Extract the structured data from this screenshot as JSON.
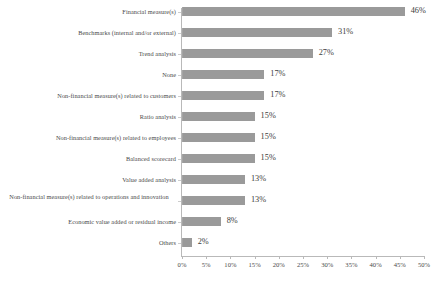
{
  "chart_data": {
    "type": "bar",
    "orientation": "horizontal",
    "title": "",
    "subtitle": "",
    "xlabel": "",
    "ylabel": "",
    "xlim": [
      0,
      50
    ],
    "grid": false,
    "legend": false,
    "bar_color": "#9a9a9a",
    "value_suffix": "%",
    "categories": [
      "Financial measure(s)",
      "Benchmarks (internal and/or external)",
      "Trend analysis",
      "None",
      "Non-financial measure(s) related to customers",
      "Ratio analysis",
      "Non-financial measure(s) related to employees",
      "Balanced scorecard",
      "Value added analysis",
      "Non-financial measure(s) related to operations and innovation",
      "Economic value added or residual income",
      "Others"
    ],
    "values": [
      46,
      31,
      27,
      17,
      17,
      15,
      15,
      15,
      13,
      13,
      8,
      2
    ],
    "value_labels": [
      "46%",
      "31%",
      "27%",
      "17%",
      "17%",
      "15%",
      "15%",
      "15%",
      "13%",
      "13%",
      "8%",
      "2%"
    ],
    "xticks": [
      0,
      5,
      10,
      15,
      20,
      25,
      30,
      35,
      40,
      45,
      50
    ],
    "xtick_labels": [
      "0%",
      "5%",
      "10%",
      "15%",
      "20%",
      "25%",
      "30%",
      "35%",
      "40%",
      "45%",
      "50%"
    ]
  }
}
